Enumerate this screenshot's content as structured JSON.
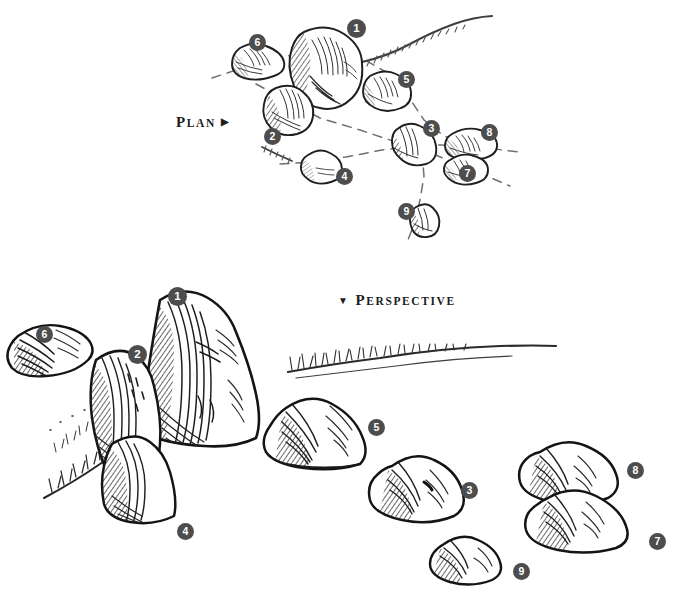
{
  "figure": {
    "title_plan": {
      "initial": "P",
      "rest": "LAN",
      "mark": "▶",
      "full": "PLAN ▶"
    },
    "title_perspective": {
      "initial": "P",
      "rest": "ERSPECTIVE",
      "mark": "▼",
      "full": "▼ PERSPECTIVE"
    },
    "background_color": "#ffffff",
    "ink_color": "#1a1a1a",
    "marker_fill": "#4d4d4d",
    "marker_text_color": "#ffffff",
    "dash_color": "#6f6f6f"
  },
  "plan": {
    "label": "PLAN ▶",
    "markers": [
      {
        "id": "1",
        "number": "1",
        "x": 347,
        "y": 19
      },
      {
        "id": "2",
        "number": "2",
        "x": 264,
        "y": 128
      },
      {
        "id": "3",
        "number": "3",
        "x": 423,
        "y": 120
      },
      {
        "id": "4",
        "number": "4",
        "x": 336,
        "y": 168
      },
      {
        "id": "5",
        "number": "5",
        "x": 398,
        "y": 71
      },
      {
        "id": "6",
        "number": "6",
        "x": 249,
        "y": 34
      },
      {
        "id": "7",
        "number": "7",
        "x": 459,
        "y": 165
      },
      {
        "id": "8",
        "number": "8",
        "x": 481,
        "y": 124
      },
      {
        "id": "9",
        "number": "9",
        "x": 398,
        "y": 203
      }
    ]
  },
  "perspective": {
    "label": "▼ PERSPECTIVE",
    "markers": [
      {
        "id": "1",
        "number": "1",
        "x": 168,
        "y": 287
      },
      {
        "id": "2",
        "number": "2",
        "x": 128,
        "y": 345
      },
      {
        "id": "3",
        "number": "3",
        "x": 461,
        "y": 482
      },
      {
        "id": "4",
        "number": "4",
        "x": 177,
        "y": 523
      },
      {
        "id": "5",
        "number": "5",
        "x": 368,
        "y": 419
      },
      {
        "id": "6",
        "number": "6",
        "x": 36,
        "y": 326
      },
      {
        "id": "7",
        "number": "7",
        "x": 649,
        "y": 533
      },
      {
        "id": "8",
        "number": "8",
        "x": 627,
        "y": 462
      },
      {
        "id": "9",
        "number": "9",
        "x": 513,
        "y": 563
      }
    ]
  },
  "chart_data": {
    "type": "diagram",
    "views": [
      "PLAN ▶",
      "▼ PERSPECTIVE"
    ],
    "object_count": 9,
    "object_labels": [
      "1",
      "2",
      "3",
      "4",
      "5",
      "6",
      "7",
      "8",
      "9"
    ],
    "annotations": [
      "dashed alignment / sight lines",
      "sketched path edge with grass tufts"
    ]
  }
}
